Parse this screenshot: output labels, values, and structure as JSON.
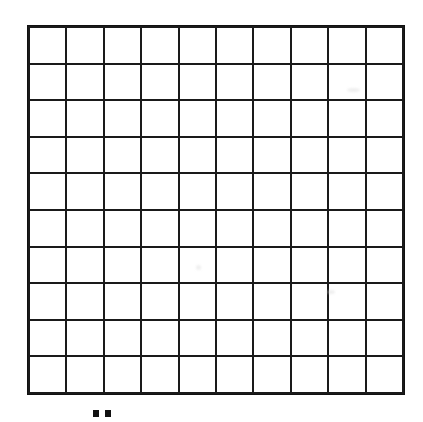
{
  "document": {
    "title": "Blank 10 by 10 grid",
    "description": "Scanned worksheet image showing an empty square grid",
    "background_color": "#ffffff",
    "line_color": "#1a1a1a"
  },
  "grid": {
    "name": "blank-grid",
    "rows": 10,
    "columns": 10,
    "total_cells": 100,
    "cell_contents": [
      [
        "",
        "",
        "",
        "",
        "",
        "",
        "",
        "",
        "",
        ""
      ],
      [
        "",
        "",
        "",
        "",
        "",
        "",
        "",
        "",
        "",
        ""
      ],
      [
        "",
        "",
        "",
        "",
        "",
        "",
        "",
        "",
        "",
        ""
      ],
      [
        "",
        "",
        "",
        "",
        "",
        "",
        "",
        "",
        "",
        ""
      ],
      [
        "",
        "",
        "",
        "",
        "",
        "",
        "",
        "",
        "",
        ""
      ],
      [
        "",
        "",
        "",
        "",
        "",
        "",
        "",
        "",
        "",
        ""
      ],
      [
        "",
        "",
        "",
        "",
        "",
        "",
        "",
        "",
        "",
        ""
      ],
      [
        "",
        "",
        "",
        "",
        "",
        "",
        "",
        "",
        "",
        ""
      ],
      [
        "",
        "",
        "",
        "",
        "",
        "",
        "",
        "",
        "",
        ""
      ],
      [
        "",
        "",
        "",
        "",
        "",
        "",
        "",
        "",
        "",
        ""
      ]
    ]
  },
  "artifacts": {
    "bottom_marks": {
      "name": "ink-marks-below-grid",
      "count": 2,
      "color": "#111111"
    },
    "smudges": {
      "name": "scan-smudges",
      "count": 3,
      "color": "#cfcfcf"
    }
  },
  "chart_data": {
    "type": "table",
    "title": "",
    "xlabel": "",
    "ylabel": "",
    "rows": 10,
    "columns": 10,
    "values": [
      [
        "",
        "",
        "",
        "",
        "",
        "",
        "",
        "",
        "",
        ""
      ],
      [
        "",
        "",
        "",
        "",
        "",
        "",
        "",
        "",
        "",
        ""
      ],
      [
        "",
        "",
        "",
        "",
        "",
        "",
        "",
        "",
        "",
        ""
      ],
      [
        "",
        "",
        "",
        "",
        "",
        "",
        "",
        "",
        "",
        ""
      ],
      [
        "",
        "",
        "",
        "",
        "",
        "",
        "",
        "",
        "",
        ""
      ],
      [
        "",
        "",
        "",
        "",
        "",
        "",
        "",
        "",
        "",
        ""
      ],
      [
        "",
        "",
        "",
        "",
        "",
        "",
        "",
        "",
        "",
        ""
      ],
      [
        "",
        "",
        "",
        "",
        "",
        "",
        "",
        "",
        "",
        ""
      ],
      [
        "",
        "",
        "",
        "",
        "",
        "",
        "",
        "",
        "",
        ""
      ],
      [
        "",
        "",
        "",
        "",
        "",
        "",
        "",
        "",
        "",
        ""
      ]
    ],
    "grid": true,
    "legend": "none"
  }
}
